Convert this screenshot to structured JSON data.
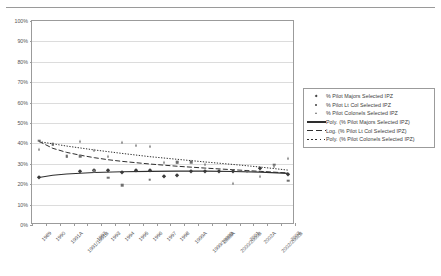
{
  "header": {
    "clipped_text": ""
  },
  "chart_data": {
    "type": "scatter",
    "title": "",
    "xlabel": "",
    "ylabel": "",
    "ylim": [
      0,
      100
    ],
    "ytick_labels": [
      "100%",
      "90%",
      "80%",
      "70%",
      "60%",
      "50%",
      "40%",
      "30%",
      "20%",
      "10%",
      "0%"
    ],
    "ytick_values": [
      100,
      90,
      80,
      70,
      60,
      50,
      40,
      30,
      20,
      10,
      0
    ],
    "grid": true,
    "legend_position": "right",
    "categories": [
      "1989",
      "1990",
      "1991A",
      "1991/1991B",
      "1992",
      "1993",
      "1994",
      "1995",
      "1996",
      "1997",
      "1998",
      "1999A",
      "1999/1999B",
      "2000A",
      "2000/2000B",
      "2001",
      "2002A",
      "2002/2002B",
      "2003"
    ],
    "series": [
      {
        "name": "% Pilot Majors Selected IPZ",
        "marker": "diamond",
        "values": [
          23.4,
          null,
          null,
          26.3,
          26.8,
          27.2,
          25.9,
          26.8,
          26.8,
          24.2,
          24.3,
          26.5,
          26.5,
          26.4,
          26.4,
          null,
          27.8,
          null,
          25.2
        ]
      },
      {
        "name": "% Pilot Lt Col Selected IPZ",
        "marker": "square",
        "values": [
          41.3,
          39.5,
          33.6,
          33.8,
          26.3,
          23.2,
          19.5,
          null,
          22.2,
          null,
          30.8,
          30.9,
          null,
          null,
          null,
          null,
          null,
          29.5,
          21.8
        ]
      },
      {
        "name": "% Pilot Colonels Selected IPZ",
        "marker": "triangle",
        "values": [
          37.2,
          39.6,
          33.6,
          41.4,
          36.8,
          33.6,
          40.8,
          39.3,
          38.5,
          30.9,
          31.0,
          31.6,
          29.9,
          null,
          20.7,
          26.7,
          24.0,
          28.8,
          32.8
        ]
      }
    ],
    "trendlines": [
      {
        "name": "Poly. (% Pilot Majors Selected IPZ)",
        "style": "solid",
        "points": [
          [
            0,
            23.3
          ],
          [
            1,
            24.4
          ],
          [
            2,
            25.0
          ],
          [
            3,
            25.4
          ],
          [
            4,
            25.7
          ],
          [
            6,
            26.1
          ],
          [
            8,
            26.3
          ],
          [
            10,
            26.4
          ],
          [
            12,
            26.4
          ],
          [
            14,
            26.2
          ],
          [
            16,
            25.9
          ],
          [
            18,
            25.3
          ]
        ]
      },
      {
        "name": "Log. (% Pilot Lt Col Selected IPZ)",
        "style": "dashed",
        "points": [
          [
            0,
            41.0
          ],
          [
            1,
            37.6
          ],
          [
            2,
            35.6
          ],
          [
            3,
            34.2
          ],
          [
            4,
            33.0
          ],
          [
            5,
            32.0
          ],
          [
            6,
            31.2
          ],
          [
            8,
            29.9
          ],
          [
            10,
            28.8
          ],
          [
            12,
            27.9
          ],
          [
            14,
            27.1
          ],
          [
            16,
            26.3
          ],
          [
            18,
            25.5
          ]
        ]
      },
      {
        "name": "Poly. (% Pilot Colonels Selected IPZ)",
        "style": "dotted",
        "points": [
          [
            0,
            40.9
          ],
          [
            2,
            38.7
          ],
          [
            4,
            36.8
          ],
          [
            6,
            35.1
          ],
          [
            8,
            33.5
          ],
          [
            10,
            32.2
          ],
          [
            12,
            30.9
          ],
          [
            14,
            29.7
          ],
          [
            16,
            28.4
          ],
          [
            18,
            26.9
          ]
        ]
      }
    ],
    "legend_entries": [
      {
        "label": "% Pilot Majors Selected IPZ",
        "mark": "diamond-marker"
      },
      {
        "label": "% Pilot Lt Col Selected IPZ",
        "mark": "square-marker"
      },
      {
        "label": "% Pilot Colonels Selected IPZ",
        "mark": "triangle-marker"
      },
      {
        "label": "Poly. (% Pilot Majors Selected IPZ)",
        "mark": "solid-line"
      },
      {
        "label": "Log. (% Pilot Lt Col Selected IPZ)",
        "mark": "dashed-line"
      },
      {
        "label": "Poly. (% Pilot Colonels Selected IPZ)",
        "mark": "dotted-line"
      }
    ],
    "colors": {
      "majors": "#3a3a3a",
      "ltcol": "#6f6f6f",
      "colonels": "#6b6b6b",
      "frame": "#9b9b9b",
      "grid": "#dcdcdc"
    }
  }
}
